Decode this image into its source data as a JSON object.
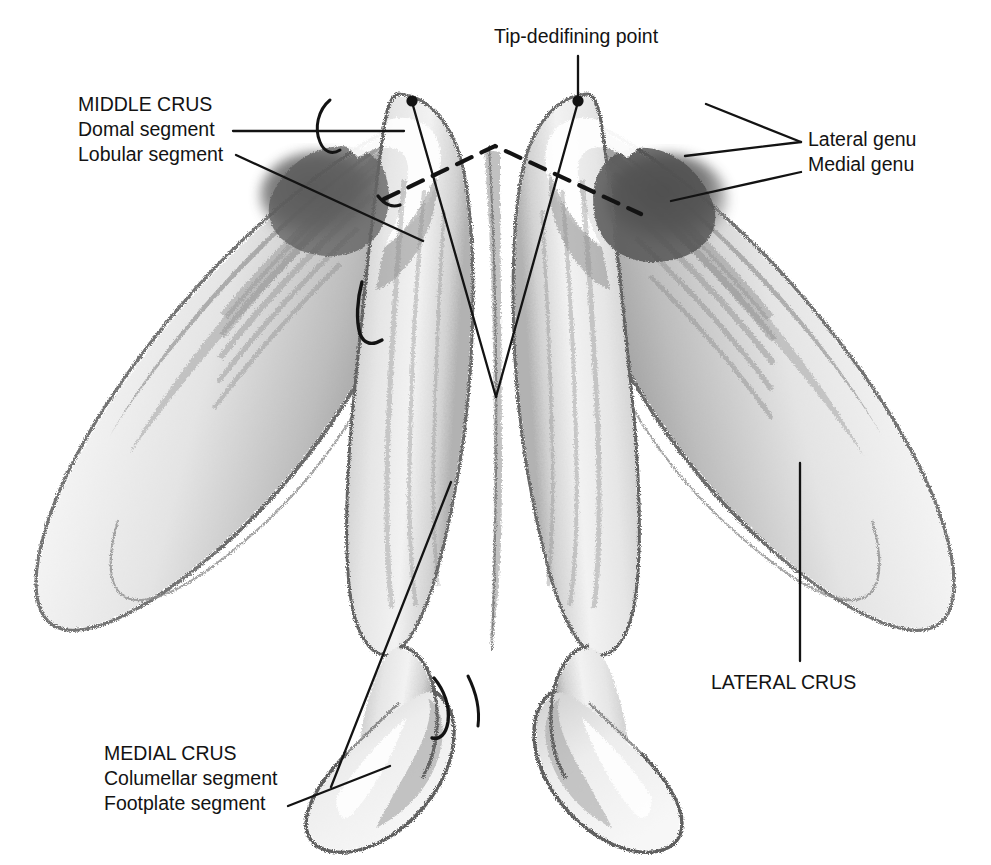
{
  "figure": {
    "title_bleedthrough": "Fig. 16. Tripod concept of lower lateral",
    "medium": "pencil / charcoal anatomical illustration",
    "background_color": "#ffffff",
    "ink_color": "#131313",
    "shading_color": "#7a7a7a"
  },
  "labels": {
    "middle_crus": {
      "heading": "MIDDLE CRUS",
      "sub1": "Domal segment",
      "sub2": "Lobular segment"
    },
    "tip_point": {
      "heading": "Tip-dedifining point"
    },
    "genu": {
      "lateral": "Lateral genu",
      "medial": "Medial genu"
    },
    "lateral_crus": {
      "heading": "LATERAL CRUS"
    },
    "medial_crus": {
      "heading": "MEDIAL CRUS",
      "sub1": "Columellar segment",
      "sub2": "Footplate segment"
    }
  },
  "annotations": {
    "tip_defining_points": [
      {
        "name": "left-dome-tip-point",
        "x": 412,
        "y": 101
      },
      {
        "name": "right-dome-tip-point",
        "x": 578,
        "y": 101
      }
    ],
    "dashed_line": {
      "name": "interdomal-dashed-line",
      "description": "dashed inverted-V marking the domal segment boundaries",
      "points": "385,198 495,145 640,212"
    },
    "leader_lines": [
      {
        "name": "leader-domal-segment",
        "from": "MIDDLE CRUS / Domal segment label",
        "path": "236,131 400,131"
      },
      {
        "name": "leader-lobular-segment",
        "from": "MIDDLE CRUS / Lobular segment label",
        "path": "238,155 420,240"
      },
      {
        "name": "leader-tip-point",
        "from": "Tip-dedifining point label",
        "path": "578,56 578,101"
      },
      {
        "name": "leader-lateral-genu",
        "from": "Lateral genu label",
        "path": "800,142 686,155"
      },
      {
        "name": "leader-medial-genu",
        "from": "Medial genu label",
        "path": "800,172 672,200"
      },
      {
        "name": "leader-lateral-crus",
        "from": "LATERAL CRUS label",
        "path": "800,660 800,462"
      },
      {
        "name": "leader-columellar-segment",
        "from": "MEDIAL CRUS / Columellar segment label",
        "path": "330,786 450,482"
      },
      {
        "name": "leader-footplate-segment",
        "from": "MEDIAL CRUS / Footplate segment label",
        "path": "292,803 388,765"
      },
      {
        "name": "leader-tippoint-left-v",
        "from": "left tip-defining point",
        "path": "412,101 495,396"
      },
      {
        "name": "leader-tippoint-right-v",
        "from": "right tip-defining point",
        "path": "578,101 495,396"
      }
    ],
    "brackets": [
      {
        "name": "bracket-left-domal",
        "description": "small hooked bracket at left dome crest"
      },
      {
        "name": "bracket-left-middle-crus",
        "description": "hooked leader terminating at left middle crus"
      },
      {
        "name": "bracket-medial-crus-junction",
        "description": "small hook at medial crura junction"
      }
    ]
  },
  "structures": [
    {
      "name": "left-lateral-crus",
      "side": "left",
      "part": "lateral crus"
    },
    {
      "name": "left-middle-crus",
      "side": "left",
      "part": "middle crus"
    },
    {
      "name": "left-medial-crus",
      "side": "left",
      "part": "medial crus"
    },
    {
      "name": "right-lateral-crus",
      "side": "right",
      "part": "lateral crus"
    },
    {
      "name": "right-middle-crus",
      "side": "right",
      "part": "middle crus"
    },
    {
      "name": "right-medial-crus",
      "side": "right",
      "part": "medial crus"
    }
  ]
}
